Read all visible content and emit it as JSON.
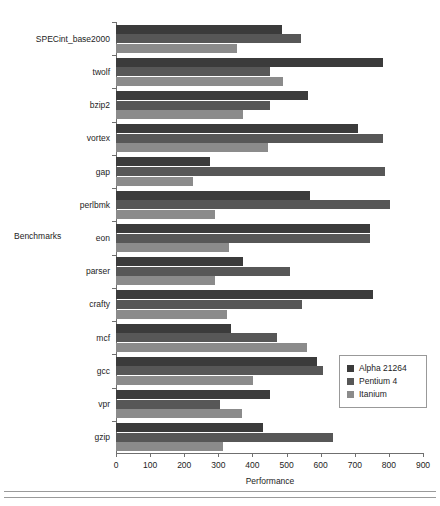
{
  "chart_data": {
    "type": "bar",
    "orientation": "horizontal",
    "title": "",
    "xlabel": "Performance",
    "ylabel": "Benchmarks",
    "xlim": [
      0,
      900
    ],
    "xticks": [
      0,
      100,
      200,
      300,
      400,
      500,
      600,
      700,
      800,
      900
    ],
    "grid": false,
    "legend_position": "right-lower",
    "categories": [
      "SPECint_base2000",
      "twolf",
      "bzip2",
      "vortex",
      "gap",
      "perlbmk",
      "eon",
      "parser",
      "crafty",
      "mcf",
      "gcc",
      "vpr",
      "gzip"
    ],
    "series": [
      {
        "name": "Alpha 21264",
        "color": "#3b3b3b",
        "values": [
          487,
          783,
          563,
          710,
          276,
          569,
          745,
          372,
          754,
          337,
          590,
          452,
          431
        ]
      },
      {
        "name": "Pentium 4",
        "color": "#575757",
        "values": [
          542,
          452,
          452,
          783,
          789,
          804,
          745,
          510,
          545,
          472,
          607,
          305,
          636
        ]
      },
      {
        "name": "Itanium",
        "color": "#8b8b8b",
        "values": [
          356,
          489,
          372,
          446,
          226,
          290,
          331,
          290,
          326,
          560,
          402,
          370,
          314
        ]
      }
    ]
  },
  "legend": {
    "items": [
      {
        "label": "Alpha 21264",
        "swatch": "alpha"
      },
      {
        "label": "Pentium 4",
        "swatch": "pentium"
      },
      {
        "label": "Itanium",
        "swatch": "itanium"
      }
    ]
  }
}
